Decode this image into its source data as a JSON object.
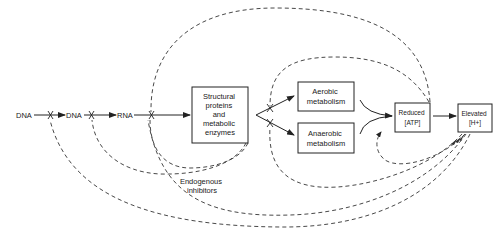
{
  "diagram": {
    "nodes": {
      "dna1": {
        "label": "DNA"
      },
      "dna2": {
        "label": "DNA"
      },
      "rna": {
        "label": "RNA"
      },
      "structural": {
        "lines": [
          "Structural",
          "proteins",
          "and",
          "metabolic",
          "enzymes"
        ]
      },
      "aerobic": {
        "lines": [
          "Aerobic",
          "metabolism"
        ]
      },
      "anaerobic": {
        "lines": [
          "Anaerobic",
          "metabolism"
        ]
      },
      "reduced_atp": {
        "lines": [
          "Reduced",
          "[ATP]"
        ]
      },
      "elevated_h": {
        "lines": [
          "Elevated",
          "[H+]"
        ]
      }
    },
    "annotations": {
      "endogenous_inhibitors": {
        "lines": [
          "Endogenous",
          "inhibitors"
        ]
      }
    },
    "edges": [
      {
        "from": "DNA",
        "to": "DNA",
        "type": "solid-arrow",
        "inhibited": true
      },
      {
        "from": "DNA",
        "to": "RNA",
        "type": "solid-arrow",
        "inhibited": true
      },
      {
        "from": "RNA",
        "to": "Structural proteins and metabolic enzymes",
        "type": "solid-arrow",
        "inhibited": true
      },
      {
        "from": "Structural proteins and metabolic enzymes",
        "to": "Aerobic metabolism",
        "type": "solid-arrow",
        "inhibited": true
      },
      {
        "from": "Structural proteins and metabolic enzymes",
        "to": "Anaerobic metabolism",
        "type": "solid-arrow",
        "inhibited": true
      },
      {
        "from": "Aerobic metabolism",
        "to": "Reduced [ATP]",
        "type": "curved-solid-arrow"
      },
      {
        "from": "Anaerobic metabolism",
        "to": "Reduced [ATP]",
        "type": "curved-solid-arrow"
      },
      {
        "from": "Reduced [ATP]",
        "to": "Elevated [H+]",
        "type": "solid-arrow"
      },
      {
        "from": "Reduced [ATP]",
        "to": "RNA->protein step",
        "type": "dashed-feedback"
      },
      {
        "from": "Reduced [ATP]",
        "to": "metabolism branch",
        "type": "dashed-feedback"
      },
      {
        "from": "Elevated [H+]",
        "to": "Reduced [ATP]",
        "type": "dashed-feedback"
      },
      {
        "from": "Elevated [H+]",
        "to": "metabolism branch",
        "type": "dashed-feedback"
      },
      {
        "from": "Elevated [H+]",
        "to": "RNA->protein step",
        "type": "dashed-feedback"
      },
      {
        "from": "Elevated [H+]",
        "to": "DNA->DNA step",
        "type": "dashed-feedback"
      },
      {
        "from": "Structural proteins and metabolic enzymes",
        "to": "DNA->RNA step",
        "type": "dashed-feedback"
      }
    ]
  }
}
